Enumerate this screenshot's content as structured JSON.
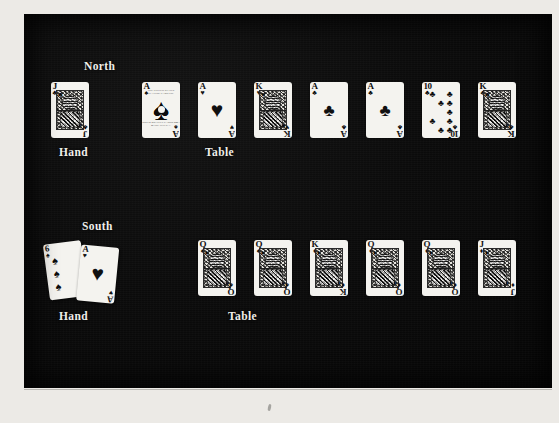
{
  "figure": {
    "background_color": "#0a0a0a",
    "page_color": "#eceae6",
    "label_color": "#efeeea"
  },
  "rows": [
    {
      "seat_label": "North",
      "hand_label": "Hand",
      "table_label": "Table",
      "hand_cards": [
        {
          "rank": "J",
          "suit": "clubs",
          "suit_glyph": "♣",
          "color": "black",
          "kind": "court",
          "name": "jack-of-clubs"
        }
      ],
      "table_cards": [
        {
          "rank": "A",
          "suit": "spades",
          "suit_glyph": "♠",
          "color": "black",
          "kind": "ace-spades",
          "name": "ace-of-spades",
          "tag_top": "THE UNITED STATES PLAYING CARD CO.",
          "tag_bottom": "JOKER BICYCLE CARDS 808 / MADE IN U.S.A."
        },
        {
          "rank": "A",
          "suit": "hearts",
          "suit_glyph": "♥",
          "color": "red",
          "kind": "ace",
          "name": "ace-of-hearts"
        },
        {
          "rank": "K",
          "suit": "hearts",
          "suit_glyph": "♥",
          "color": "red",
          "kind": "court",
          "name": "king-of-hearts"
        },
        {
          "rank": "A",
          "suit": "clubs",
          "suit_glyph": "♣",
          "color": "black",
          "kind": "ace",
          "name": "ace-of-clubs"
        },
        {
          "rank": "A",
          "suit": "clubs",
          "suit_glyph": "♣",
          "color": "black",
          "kind": "ace",
          "name": "ace-of-clubs"
        },
        {
          "rank": "10",
          "suit": "clubs",
          "suit_glyph": "♣",
          "color": "black",
          "kind": "spot",
          "name": "ten-of-clubs"
        },
        {
          "rank": "K",
          "suit": "clubs",
          "suit_glyph": "♣",
          "color": "black",
          "kind": "court",
          "name": "king-of-clubs"
        }
      ]
    },
    {
      "seat_label": "South",
      "hand_label": "Hand",
      "table_label": "Table",
      "hand_cards": [
        {
          "rank": "6",
          "suit": "spades",
          "suit_glyph": "♠",
          "color": "black",
          "kind": "spot-col",
          "name": "six-of-spades"
        },
        {
          "rank": "A",
          "suit": "hearts",
          "suit_glyph": "♥",
          "color": "red",
          "kind": "ace",
          "name": "ace-of-hearts"
        }
      ],
      "table_cards": [
        {
          "rank": "Q",
          "suit": "spades",
          "suit_glyph": "♠",
          "color": "black",
          "kind": "court",
          "name": "queen-of-spades"
        },
        {
          "rank": "Q",
          "suit": "spades",
          "suit_glyph": "♠",
          "color": "black",
          "kind": "court",
          "name": "queen-of-spades"
        },
        {
          "rank": "K",
          "suit": "diamonds",
          "suit_glyph": "♦",
          "color": "red",
          "kind": "court",
          "name": "king-of-diamonds"
        },
        {
          "rank": "Q",
          "suit": "diamonds",
          "suit_glyph": "♦",
          "color": "red",
          "kind": "court",
          "name": "queen-of-diamonds"
        },
        {
          "rank": "Q",
          "suit": "diamonds",
          "suit_glyph": "♦",
          "color": "red",
          "kind": "court",
          "name": "queen-of-diamonds"
        },
        {
          "rank": "J",
          "suit": "diamonds",
          "suit_glyph": "♦",
          "color": "red",
          "kind": "court",
          "name": "jack-of-diamonds"
        }
      ]
    }
  ],
  "layout": {
    "card_width": 38,
    "card_height": 56,
    "north_label_x": 60,
    "north_label_y": 46,
    "north_hand_x": 27,
    "north_row_y": 68,
    "north_hand_label_x": 35,
    "north_label_bottom_y": 132,
    "north_table_x": 118,
    "north_table_gap": 56,
    "north_table_label_x": 181,
    "south_label_x": 58,
    "south_label_y": 206,
    "south_hand_x": 30,
    "south_row_y": 226,
    "south_hand_label_x": 35,
    "south_label_bottom_y": 296,
    "south_table_x": 174,
    "south_table_gap": 56,
    "south_table_label_x": 204
  }
}
